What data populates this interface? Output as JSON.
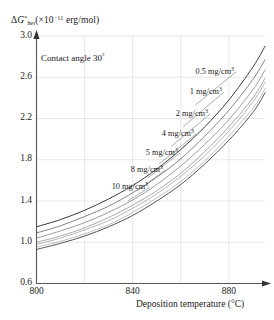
{
  "chart_data": {
    "type": "line",
    "title": "",
    "xlabel": "Deposition temperature (°C)",
    "ylabel": "ΔG*het (×10⁻¹¹ erg/mol)",
    "ylabel_parts": {
      "delta": "Δ",
      "symbol": "G",
      "superscript": "*",
      "subscript": "het",
      "units_prefix": "(×10",
      "units_exponent": "−11",
      "units_suffix": " erg/mol)"
    },
    "annotation": "Contact angle 30°",
    "annotation_text": "Contact angle 30",
    "annotation_sup": "°",
    "xlim": [
      800,
      895
    ],
    "ylim": [
      0.6,
      3.0
    ],
    "xticks": [
      800,
      840,
      880
    ],
    "xtick_labels": [
      "800",
      "840",
      "880"
    ],
    "yticks": [
      0.6,
      1.0,
      1.4,
      1.8,
      2.2,
      2.6,
      3.0
    ],
    "ytick_labels": [
      "0.6",
      "1.0",
      "1.4",
      "1.8",
      "2.2",
      "2.6",
      "3.0"
    ],
    "grid": true,
    "legend_position": "inline-labels-with-leader-lines",
    "x": [
      800,
      810,
      820,
      830,
      840,
      850,
      860,
      870,
      880,
      890,
      895
    ],
    "series": [
      {
        "name": "0.5 mg/cm3",
        "label_text": "0.5 mg/cm",
        "label_sup": "3",
        "color": "#3a3a3a",
        "values": [
          1.15,
          1.22,
          1.31,
          1.42,
          1.55,
          1.71,
          1.9,
          2.12,
          2.38,
          2.7,
          2.9
        ]
      },
      {
        "name": "1 mg/cm3",
        "label_text": "1 mg/cm",
        "label_sup": "3",
        "color": "#6e6e6e",
        "values": [
          1.09,
          1.16,
          1.25,
          1.35,
          1.48,
          1.63,
          1.81,
          2.03,
          2.28,
          2.58,
          2.77
        ]
      },
      {
        "name": "2 mg/cm3",
        "label_text": "2 mg/cm",
        "label_sup": "3",
        "color": "#8a8a8a",
        "values": [
          1.04,
          1.11,
          1.19,
          1.29,
          1.41,
          1.56,
          1.74,
          1.95,
          2.19,
          2.48,
          2.67
        ]
      },
      {
        "name": "4 mg/cm3",
        "label_text": "4 mg/cm",
        "label_sup": "3",
        "color": "#9a9a9a",
        "values": [
          1.0,
          1.06,
          1.14,
          1.24,
          1.36,
          1.5,
          1.67,
          1.88,
          2.12,
          2.4,
          2.59
        ]
      },
      {
        "name": "5 mg/cm3",
        "label_text": "5 mg/cm",
        "label_sup": "3",
        "color": "#a6a6a6",
        "values": [
          0.98,
          1.04,
          1.12,
          1.21,
          1.33,
          1.47,
          1.64,
          1.84,
          2.08,
          2.36,
          2.55
        ]
      },
      {
        "name": "8 mg/cm3",
        "label_text": "8 mg/cm",
        "label_sup": "3",
        "color": "#b4b4b4",
        "values": [
          0.95,
          1.01,
          1.08,
          1.17,
          1.29,
          1.43,
          1.59,
          1.79,
          2.03,
          2.3,
          2.49
        ]
      },
      {
        "name": "10 mg/cm3",
        "label_text": "10 mg/cm",
        "label_sup": "3",
        "color": "#555555",
        "values": [
          0.93,
          0.99,
          1.06,
          1.15,
          1.26,
          1.4,
          1.56,
          1.76,
          1.99,
          2.26,
          2.45
        ]
      }
    ]
  },
  "axes": {
    "x_arrow": true,
    "y_arrow": true,
    "frame_color": "#555555",
    "grid_color": "#dcdcdc"
  }
}
